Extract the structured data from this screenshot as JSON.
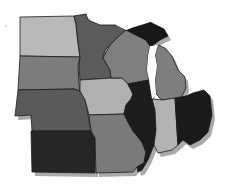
{
  "map": {
    "region": "Midwest United States",
    "style": "grayscale",
    "shadow_color": "#9a9a9a",
    "background": "#ffffff",
    "states": [
      {
        "name": "North Dakota",
        "fill": "#b9b9b9",
        "points": "20,17 74,16 76,24 78,43 80,57 20,56"
      },
      {
        "name": "South Dakota",
        "fill": "#7c7c7c",
        "points": "20,56 80,57 78,66 79,85 80,91 74,89 18,90"
      },
      {
        "name": "Nebraska",
        "fill": "#5a5a5a",
        "points": "18,90 74,89 80,91 85,100 88,115 91,131 32,131 31,115 15,116"
      },
      {
        "name": "Kansas",
        "fill": "#262626",
        "points": "31,131 91,131 95,138 95,173 32,172"
      },
      {
        "name": "Minnesota",
        "fill": "#5b5b5b",
        "points": "74,16 86,14 88,20 100,25 116,25 126,30 118,37 110,45 105,50 103,58 110,70 111,78 80,80 79,66 80,57 78,43 76,24"
      },
      {
        "name": "Iowa",
        "fill": "#b0b0b0",
        "points": "80,80 111,78 122,78 128,84 133,94 131,99 126,105 124,114 89,115 85,100 80,91"
      },
      {
        "name": "Missouri",
        "fill": "#7a7a7a",
        "points": "89,115 124,114 128,122 133,131 142,142 146,152 144,163 137,167 133,172 96,173 95,138 91,131"
      },
      {
        "name": "Wisconsin",
        "fill": "#7f7f7f",
        "points": "103,58 110,45 118,37 126,30 136,35 146,40 150,46 148,56 147,70 149,80 128,84 122,78 111,78 110,70"
      },
      {
        "name": "Michigan Upper",
        "fill": "#171717",
        "points": "126,30 134,27 144,24 150,22 156,25 164,29 168,36 160,40 152,46 150,46 146,40 136,35"
      },
      {
        "name": "Michigan Lower",
        "fill": "#7e7e7e",
        "points": "158,45 165,48 172,56 178,70 185,77 186,88 181,98 162,100 156,94 155,80 157,66 155,55"
      },
      {
        "name": "Illinois",
        "fill": "#1d1d1d",
        "points": "128,84 149,80 152,95 155,110 156,130 154,145 148,160 142,170 138,172 137,167 144,163 146,152 142,142 133,131 128,122 124,114 126,105 131,99 133,94"
      },
      {
        "name": "Indiana",
        "fill": "#b3b3b3",
        "points": "152,99 162,100 175,98 177,130 178,145 172,150 158,153 154,145 156,130 155,110"
      },
      {
        "name": "Ohio",
        "fill": "#1a1a1a",
        "points": "175,98 186,96 193,93 204,90 210,96 212,115 208,132 200,140 190,145 183,140 178,145 177,130"
      }
    ],
    "lakes": [
      {
        "name": "Lake Michigan",
        "points": "150,46 152,46 158,45 155,55 157,66 155,80 156,94 152,99 149,80 147,70 148,56"
      },
      {
        "name": "Lake Superior",
        "points": "118,18 126,16 140,15 152,16 160,20 150,22 144,24 134,27 126,30 116,25"
      }
    ],
    "mark": {
      "x": 6,
      "y": 26
    }
  }
}
